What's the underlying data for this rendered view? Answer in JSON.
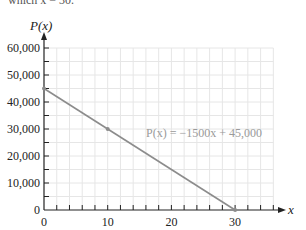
{
  "top_text": "which x = 30.",
  "chart_data": {
    "type": "line",
    "title": "",
    "xlabel": "x",
    "ylabel": "P(x)",
    "xlim": [
      0,
      36
    ],
    "ylim": [
      0,
      60000
    ],
    "x_ticks": [
      0,
      10,
      20,
      30
    ],
    "x_tick_labels": [
      "0",
      "10",
      "20",
      "30"
    ],
    "y_ticks": [
      0,
      10000,
      20000,
      30000,
      40000,
      50000,
      60000
    ],
    "y_tick_labels": [
      "0",
      "10,000",
      "20,000",
      "30,000",
      "40,000",
      "50,000",
      "60,000"
    ],
    "grid": true,
    "series": [
      {
        "name": "P(x) = −1500x + 45,000",
        "x": [
          0,
          10,
          30
        ],
        "y": [
          45000,
          30000,
          0
        ]
      }
    ],
    "marked_points": [
      {
        "x": 0,
        "y": 45000
      },
      {
        "x": 10,
        "y": 30000
      },
      {
        "x": 30,
        "y": 0
      }
    ],
    "annotation": "P(x) = −1500x + 45,000",
    "colors": {
      "line": "#8c8c8c",
      "grid": "#e6e6e6",
      "axis": "#222222",
      "annotation": "#9a9a9a"
    }
  }
}
